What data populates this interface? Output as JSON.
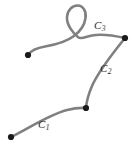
{
  "figure": {
    "kind": "piecewise-curve-diagram",
    "width": 135,
    "height": 146,
    "background_color": "#ffffff",
    "stroke_color": "#808080",
    "node_color": "#1a1a1a",
    "label_color": "#2b2b2b",
    "stroke_width": 2.6,
    "node_radius": 3.1
  },
  "labels": {
    "c1": {
      "base": "C",
      "sub": "1"
    },
    "c2": {
      "base": "C",
      "sub": "2"
    },
    "c3": {
      "base": "C",
      "sub": "3"
    }
  },
  "nodes": [
    {
      "name": "c1-start",
      "x": 11,
      "y": 137
    },
    {
      "name": "c1-end-c2-start",
      "x": 86,
      "y": 108
    },
    {
      "name": "c2-end-c3-start",
      "x": 125,
      "y": 38
    },
    {
      "name": "c3-end",
      "x": 28,
      "y": 55
    }
  ],
  "curves": [
    {
      "name": "c1",
      "label": "C1",
      "path": "M 11 137 C 26 130, 48 115, 67 110 C 74 108.2, 81 107.6, 86 108"
    },
    {
      "name": "c2",
      "label": "C2",
      "path": "M 125 38 C 113 53, 99 70, 92 86 C 88.5 94, 86.6 101, 86 108"
    },
    {
      "name": "c3",
      "label": "C3",
      "path": "M 125 38 C 114 35.5, 101 33.5, 92 35.5 C 86 36.8, 81 39.4, 78.5 37.5 C 73 33.3, 66.5 25, 67 17 C 67.4 10.5, 72 5.5, 77.5 5.5 C 83 5.5, 86.5 11, 85.5 18 C 84.6 24.5, 80 31.5, 74 36 C 66 42, 54 45, 45 46.5 C 37 47.8, 31 50.5, 28 55"
    }
  ]
}
